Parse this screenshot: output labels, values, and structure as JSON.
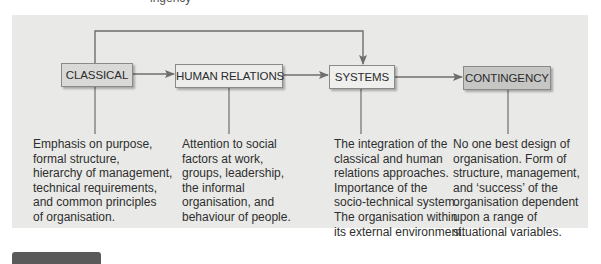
{
  "top_fragment": "ingency",
  "diagram": {
    "colors": {
      "panel": "#e9e9e7",
      "line": "#6e6e6e",
      "classical_fill": "#d9d9d8",
      "human_relations_fill": "#ededec",
      "systems_fill": "#efefee",
      "contingency_fill": "#c6c6c5"
    },
    "nodes": [
      {
        "id": "classical",
        "label": "CLASSICAL",
        "description": [
          "Emphasis on purpose,",
          "formal structure,",
          "hierarchy of management,",
          "technical requirements,",
          "and common principles",
          "of organisation."
        ]
      },
      {
        "id": "human-relations",
        "label": "HUMAN RELATIONS",
        "description": [
          "Attention to social",
          "factors at work,",
          "groups, leadership,",
          "the informal",
          "organisation, and",
          "behaviour of people."
        ]
      },
      {
        "id": "systems",
        "label": "SYSTEMS",
        "description": [
          "The integration of the",
          "classical and human",
          "relations approaches.",
          "Importance of the",
          "socio-technical system.",
          "The organisation within",
          "its external environment."
        ]
      },
      {
        "id": "contingency",
        "label": "CONTINGENCY",
        "description": [
          "No one best design of",
          "organisation. Form of",
          "structure, management,",
          "and ‘success’ of the",
          "organisation dependent",
          "upon a range of",
          "situational variables."
        ]
      }
    ],
    "edges": [
      {
        "from": "classical",
        "to": "human-relations"
      },
      {
        "from": "human-relations",
        "to": "systems"
      },
      {
        "from": "systems",
        "to": "contingency"
      },
      {
        "from": "classical",
        "to": "systems",
        "route": "over-top"
      }
    ]
  }
}
